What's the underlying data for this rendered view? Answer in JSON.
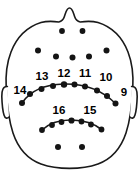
{
  "figure": {
    "kind": "eeg-electrode-placement-map",
    "view": "head-top-down",
    "background_color": "#ffffff",
    "outline_color": "#1a1a1a",
    "electrode_color": "#141414",
    "label_color": "#000000"
  },
  "anatomy": {
    "nose_name": "nose-marker",
    "left_ear_name": "left-ear-marker",
    "right_ear_name": "right-ear-marker",
    "head_name": "head-outline"
  },
  "electrodes": {
    "frontal_pair": [
      {
        "id": "fp-left",
        "cx": 62.0,
        "cy": 31.0,
        "r": 2.9
      },
      {
        "id": "fp-right",
        "cx": 82.5,
        "cy": 31.0,
        "r": 2.9
      }
    ],
    "frontal_row": [
      {
        "id": "f-1",
        "cx": 38.0,
        "cy": 50.5,
        "r": 3.0
      },
      {
        "id": "f-2",
        "cx": 56.0,
        "cy": 56.5,
        "r": 3.0
      },
      {
        "id": "f-3",
        "cx": 72.5,
        "cy": 57.5,
        "r": 3.0
      },
      {
        "id": "f-4",
        "cx": 89.0,
        "cy": 56.5,
        "r": 3.0
      },
      {
        "id": "f-5",
        "cx": 106.5,
        "cy": 50.5,
        "r": 3.0
      }
    ],
    "upper_arc": [
      {
        "id": "ua-1",
        "cx": 22.0,
        "cy": 103.0,
        "r": 3.0
      },
      {
        "id": "ua-2",
        "cx": 30.0,
        "cy": 94.0,
        "r": 3.0
      },
      {
        "id": "ua-3",
        "cx": 41.5,
        "cy": 89.0,
        "r": 3.0
      },
      {
        "id": "ua-4",
        "cx": 53.0,
        "cy": 86.0,
        "r": 3.0
      },
      {
        "id": "ua-5",
        "cx": 64.0,
        "cy": 84.5,
        "r": 3.2
      },
      {
        "id": "ua-6",
        "cx": 74.5,
        "cy": 84.5,
        "r": 3.0
      },
      {
        "id": "ua-7",
        "cx": 85.0,
        "cy": 86.5,
        "r": 3.0
      },
      {
        "id": "ua-8",
        "cx": 97.0,
        "cy": 90.5,
        "r": 3.0
      },
      {
        "id": "ua-9",
        "cx": 107.0,
        "cy": 96.0,
        "r": 3.0
      },
      {
        "id": "ua-10",
        "cx": 115.5,
        "cy": 103.5,
        "r": 3.0
      }
    ],
    "lower_arc": [
      {
        "id": "la-1",
        "cx": 42.0,
        "cy": 130.0,
        "r": 2.9
      },
      {
        "id": "la-2",
        "cx": 52.0,
        "cy": 125.0,
        "r": 2.9
      },
      {
        "id": "la-3",
        "cx": 61.5,
        "cy": 122.0,
        "r": 2.9
      },
      {
        "id": "la-4",
        "cx": 71.5,
        "cy": 120.5,
        "r": 3.1
      },
      {
        "id": "la-5",
        "cx": 81.5,
        "cy": 121.5,
        "r": 2.9
      },
      {
        "id": "la-6",
        "cx": 91.0,
        "cy": 124.5,
        "r": 2.9
      },
      {
        "id": "la-7",
        "cx": 101.5,
        "cy": 129.5,
        "r": 2.9
      }
    ],
    "occipital_pair": [
      {
        "id": "oc-left",
        "cx": 58.0,
        "cy": 147.0,
        "r": 3.0
      },
      {
        "id": "oc-right",
        "cx": 82.0,
        "cy": 147.0,
        "r": 3.0
      }
    ]
  },
  "labels": [
    {
      "name": "electrode-label-14",
      "text": "14",
      "x": 20.0,
      "y": 94.0
    },
    {
      "name": "electrode-label-13",
      "text": "13",
      "x": 42.0,
      "y": 80.0
    },
    {
      "name": "electrode-label-12",
      "text": "12",
      "x": 64.0,
      "y": 76.5
    },
    {
      "name": "electrode-label-11",
      "text": "11",
      "x": 85.0,
      "y": 76.5
    },
    {
      "name": "electrode-label-10",
      "text": "10",
      "x": 106.0,
      "y": 81.0
    },
    {
      "name": "electrode-label-9",
      "text": "9",
      "x": 124.0,
      "y": 95.5
    },
    {
      "name": "electrode-label-16",
      "text": "16",
      "x": 59.0,
      "y": 114.0
    },
    {
      "name": "electrode-label-15",
      "text": "15",
      "x": 90.0,
      "y": 114.0
    }
  ]
}
